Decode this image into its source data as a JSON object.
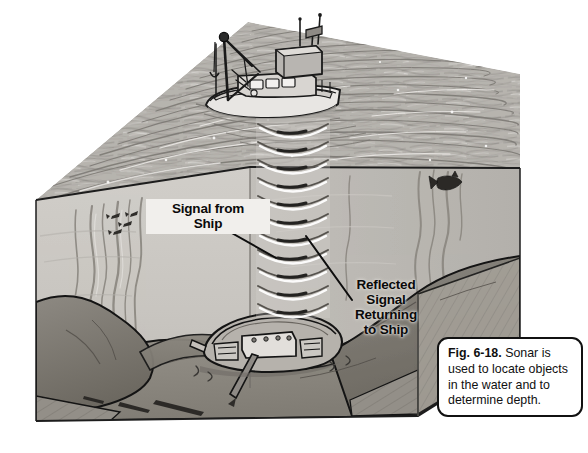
{
  "figure": {
    "kind": "textbook-illustration",
    "description_visible_text_only": true
  },
  "callouts": [
    {
      "id": "signal-from-ship",
      "text": "Signal from\nShip",
      "style": "bold",
      "has_white_backing": true
    },
    {
      "id": "reflected-signal",
      "text": "Reflected\nSignal\nReturning\nto Ship",
      "style": "bold",
      "has_white_backing": false
    }
  ],
  "caption": {
    "figure_number": "Fig. 6-18.",
    "body": " Sonar is used to locate objects in the water and to determine depth."
  },
  "colors": {
    "ink": "#111111",
    "paper": "#ffffff",
    "water_surface": "#b9b6b1",
    "water_body": "#c9c6c1",
    "water_body_right": "#bdbab5",
    "seafloor": "#9a968f",
    "seafloor_dark": "#6e6a64",
    "wave_highlight": "#f2f0ed"
  },
  "scene_elements": [
    {
      "name": "fishing-boat",
      "label": "fishing boat with crane at water surface"
    },
    {
      "name": "sonar-wave-column",
      "label": "column of stacked sonar arcs"
    },
    {
      "name": "shipwreck",
      "label": "sunken ship on the seafloor"
    },
    {
      "name": "fish",
      "label": "fish swimming in the water"
    },
    {
      "name": "kelp",
      "label": "strands of kelp / seaweed"
    },
    {
      "name": "seafloor",
      "label": "rocky ocean bottom"
    }
  ]
}
